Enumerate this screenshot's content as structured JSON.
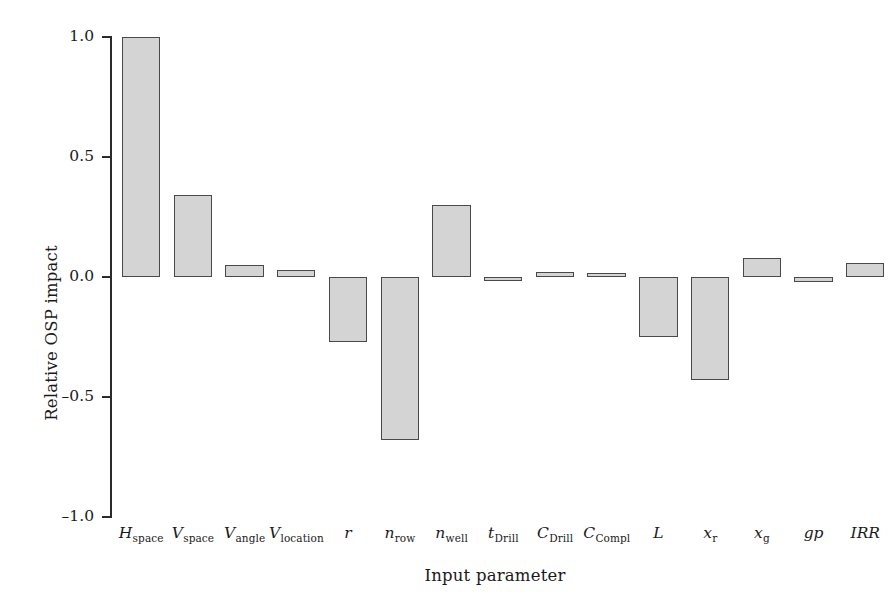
{
  "chart_data": {
    "type": "bar",
    "title": "",
    "xlabel": "Input parameter",
    "ylabel": "Relative OSP impact",
    "ylim": [
      -1.0,
      1.0
    ],
    "ytick_values": [
      1.0,
      0.5,
      0.0,
      -0.5,
      -1.0
    ],
    "ytick_labels": [
      "1.0",
      "0.5",
      "0.0",
      "–0.5",
      "–1.0"
    ],
    "grid": false,
    "legend": null,
    "bar_fill_color": "#d4d4d4",
    "bar_edge_color": "#494949",
    "axis_color": "#2b2b2b",
    "categories": [
      "H_space",
      "V_space",
      "V_angle",
      "V_location",
      "r",
      "n_row",
      "n_well",
      "t_Drill",
      "C_Drill",
      "C_Compl",
      "L",
      "x_r",
      "x_g",
      "gp",
      "IRR"
    ],
    "category_labels": [
      {
        "base": "H",
        "sub": "space",
        "italic": true
      },
      {
        "base": "V",
        "sub": "space",
        "italic": true
      },
      {
        "base": "V",
        "sub": "angle",
        "italic": true
      },
      {
        "base": "V",
        "sub": "location",
        "italic": true
      },
      {
        "base": "r",
        "sub": "",
        "italic": true
      },
      {
        "base": "n",
        "sub": "row",
        "italic": true
      },
      {
        "base": "n",
        "sub": "well",
        "italic": true
      },
      {
        "base": "t",
        "sub": "Drill",
        "italic": true
      },
      {
        "base": "C",
        "sub": "Drill",
        "italic": true
      },
      {
        "base": "C",
        "sub": "Compl",
        "italic": true
      },
      {
        "base": "L",
        "sub": "",
        "italic": true
      },
      {
        "base": "x",
        "sub": "r",
        "italic": true
      },
      {
        "base": "x",
        "sub": "g",
        "italic": true
      },
      {
        "base": "gp",
        "sub": "",
        "italic": true
      },
      {
        "base": "IRR",
        "sub": "",
        "italic": false
      }
    ],
    "values": [
      1.0,
      0.34,
      0.05,
      0.03,
      -0.27,
      -0.68,
      0.3,
      -0.005,
      0.02,
      0.015,
      -0.25,
      -0.43,
      0.08,
      -0.02,
      0.06
    ]
  }
}
